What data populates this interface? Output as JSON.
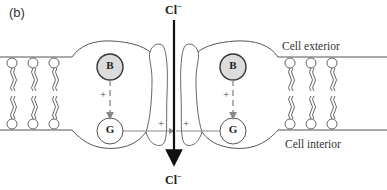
{
  "figure": {
    "panel_label": "(b)",
    "ion_top": "Cl",
    "ion_top_charge": "−",
    "ion_bottom": "Cl",
    "ion_bottom_charge": "−",
    "label_exterior": "Cell exterior",
    "label_interior": "Cell interior",
    "subunits": [
      {
        "top_circle": "B",
        "bottom_circle": "G",
        "coupling_sign": "+"
      },
      {
        "top_circle": "B",
        "bottom_circle": "G",
        "coupling_sign": "+"
      }
    ],
    "pore_signs": [
      "+",
      "+"
    ],
    "colors": {
      "line": "#555555",
      "arrow": "#111111",
      "b_fill": "#dcdcdc",
      "g_fill": "#ffffff",
      "dashed": "#888888"
    }
  }
}
